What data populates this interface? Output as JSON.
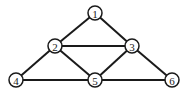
{
  "graph": {
    "nodes": [
      {
        "id": "1",
        "label": "1",
        "x": 95,
        "y": 13
      },
      {
        "id": "2",
        "label": "2",
        "x": 55,
        "y": 46
      },
      {
        "id": "3",
        "label": "3",
        "x": 132,
        "y": 46
      },
      {
        "id": "4",
        "label": "4",
        "x": 16,
        "y": 80
      },
      {
        "id": "5",
        "label": "5",
        "x": 95,
        "y": 80
      },
      {
        "id": "6",
        "label": "6",
        "x": 172,
        "y": 80
      }
    ],
    "edges": [
      {
        "from": "1",
        "to": "2"
      },
      {
        "from": "1",
        "to": "3"
      },
      {
        "from": "2",
        "to": "3"
      },
      {
        "from": "2",
        "to": "4"
      },
      {
        "from": "2",
        "to": "5"
      },
      {
        "from": "3",
        "to": "5"
      },
      {
        "from": "3",
        "to": "6"
      },
      {
        "from": "4",
        "to": "5"
      },
      {
        "from": "5",
        "to": "6"
      }
    ],
    "node_radius": 7,
    "colors": {
      "stroke": "#1a1a1a",
      "fill": "#ffffff"
    }
  }
}
